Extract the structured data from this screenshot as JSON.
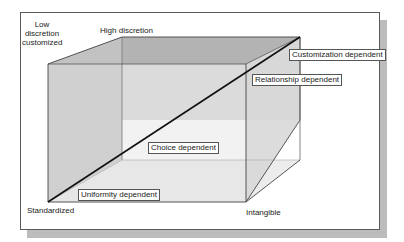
{
  "diagram": {
    "type": "cube",
    "corner_labels": {
      "low_discretion": "Low\ndiscretion\ncustomized",
      "high_discretion": "High discretion",
      "standardized": "Standardized",
      "intangible": "Intangible"
    },
    "region_labels": {
      "customization": "Customization dependent",
      "relationship": "Relationship dependent",
      "choice": "Choice dependent",
      "uniformity": "Uniformity dependent"
    },
    "colors": {
      "frame_border": "#5a5a5a",
      "shadow": "#bcbcbc",
      "cube_edge": "#444444",
      "top_face": "#b5b5b5",
      "left_face": "#c4c4c4",
      "back_face": "#d4d4d4",
      "bottom_face": "#e6e6e6",
      "right_face": "#dcdcdc",
      "diagonal": "#111111"
    }
  }
}
